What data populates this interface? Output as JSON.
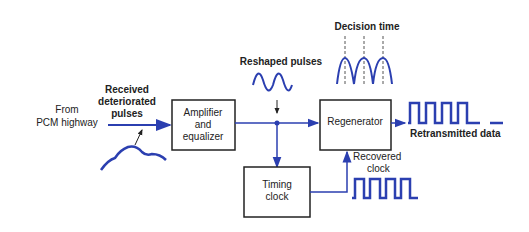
{
  "labels": {
    "source_line1": "From",
    "source_line2": "PCM highway",
    "received_line1": "Received",
    "received_line2": "deteriorated",
    "received_line3": "pulses",
    "reshaped": "Reshaped pulses",
    "decision": "Decision time",
    "retransmitted": "Retransmitted data",
    "recovered_line1": "Recovered",
    "recovered_line2": "clock"
  },
  "blocks": {
    "amplifier_line1": "Amplifier",
    "amplifier_line2": "and",
    "amplifier_line3": "equalizer",
    "regenerator": "Regenerator",
    "timing_line1": "Timing",
    "timing_line2": "clock"
  },
  "colors": {
    "signal": "#2b3fb0",
    "box": "#222222"
  }
}
